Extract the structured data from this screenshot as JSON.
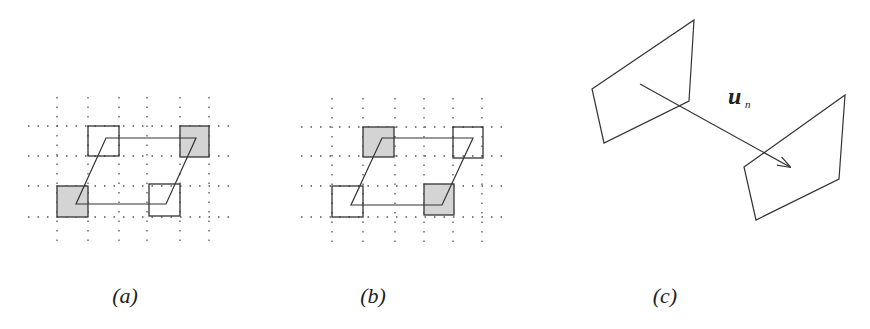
{
  "panels": [
    {
      "id": "a",
      "label": "(a)",
      "grid": {
        "xs": [
          57,
          88,
          119,
          147,
          180,
          209
        ],
        "ys": [
          126,
          156,
          186,
          217
        ],
        "x_range": [
          28,
          235
        ],
        "y_range": [
          97,
          246
        ]
      },
      "squares": [
        {
          "x": 88,
          "y": 126,
          "w": 31,
          "h": 30,
          "shaded": false
        },
        {
          "x": 180,
          "y": 126,
          "w": 29,
          "h": 31,
          "shaded": true
        },
        {
          "x": 57,
          "y": 186,
          "w": 31,
          "h": 31,
          "shaded": true
        },
        {
          "x": 149,
          "y": 184,
          "w": 31,
          "h": 32,
          "shaded": false
        }
      ],
      "parallelogram": [
        [
          106,
          138
        ],
        [
          196,
          138
        ],
        [
          166,
          204
        ],
        [
          76,
          204
        ]
      ]
    },
    {
      "id": "b",
      "label": "(b)",
      "grid": {
        "xs": [
          332,
          363,
          395,
          424,
          453,
          482
        ],
        "ys": [
          127,
          156,
          186,
          217
        ],
        "x_range": [
          301,
          510
        ],
        "y_range": [
          98,
          246
        ]
      },
      "squares": [
        {
          "x": 363,
          "y": 127,
          "w": 31,
          "h": 30,
          "shaded": true
        },
        {
          "x": 453,
          "y": 127,
          "w": 30,
          "h": 31,
          "shaded": false
        },
        {
          "x": 332,
          "y": 186,
          "w": 31,
          "h": 31,
          "shaded": false
        },
        {
          "x": 424,
          "y": 184,
          "w": 30,
          "h": 31,
          "shaded": true
        }
      ],
      "parallelogram": [
        [
          382,
          138
        ],
        [
          473,
          138
        ],
        [
          442,
          205
        ],
        [
          351,
          205
        ]
      ]
    },
    {
      "id": "c",
      "label": "(c)",
      "quad_left": [
        [
          592,
          89
        ],
        [
          694,
          20
        ],
        [
          689,
          101
        ],
        [
          604,
          143
        ]
      ],
      "quad_right": [
        [
          744,
          167
        ],
        [
          845,
          95
        ],
        [
          839,
          179
        ],
        [
          756,
          220
        ]
      ],
      "arrow": {
        "from": [
          640,
          84
        ],
        "to": [
          790,
          167
        ]
      },
      "vector_label": "u",
      "vector_subscript": "n"
    }
  ],
  "labels": [
    {
      "text": "(a)",
      "x": 125,
      "y": 303
    },
    {
      "text": "(b)",
      "x": 373,
      "y": 303
    },
    {
      "text": "(c)",
      "x": 665,
      "y": 303
    }
  ],
  "colors": {
    "stroke": "#333333",
    "shade": "#d4d4d4",
    "grid": "#555555"
  }
}
